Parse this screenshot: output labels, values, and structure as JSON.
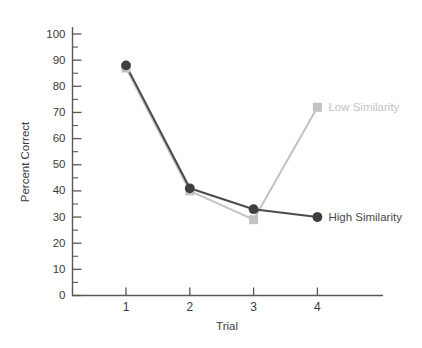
{
  "chart_data": {
    "type": "line",
    "title": "",
    "xlabel": "Trial",
    "ylabel": "Percent Correct",
    "categories": [
      "1",
      "2",
      "3",
      "4"
    ],
    "x": [
      1,
      2,
      3,
      4
    ],
    "xlim": [
      0.5,
      4.6
    ],
    "ylim": [
      0,
      100
    ],
    "y_tick_step": 10,
    "y_minor_step": 5,
    "grid": false,
    "legend_position": "inline-right",
    "series": [
      {
        "name": "High Similarity",
        "color": "#3f3f41",
        "marker": "circle",
        "values": [
          88,
          41,
          33,
          30
        ],
        "label_point": {
          "x": 4,
          "y": 30
        }
      },
      {
        "name": "Low Similarity",
        "color": "#c3c3c3",
        "marker": "square",
        "values": [
          87,
          40,
          29,
          72
        ],
        "label_point": {
          "x": 4,
          "y": 72
        }
      }
    ],
    "y_tick_labels": [
      "0",
      "10",
      "20",
      "30",
      "40",
      "50",
      "60",
      "70",
      "80",
      "90",
      "100"
    ],
    "y_tick_values": [
      0,
      10,
      20,
      30,
      40,
      50,
      60,
      70,
      80,
      90,
      100
    ],
    "x_tick_labels": [
      "1",
      "2",
      "3",
      "4"
    ],
    "annotations": [
      {
        "text": "Low Similarity",
        "color": "#c3c3c3"
      },
      {
        "text": "High Similarity",
        "color": "#4a4a4c"
      }
    ]
  },
  "labels": {
    "y_axis_title": "Percent Correct",
    "x_axis_title": "Trial",
    "series_low": "Low Similarity",
    "series_high": "High Similarity"
  }
}
